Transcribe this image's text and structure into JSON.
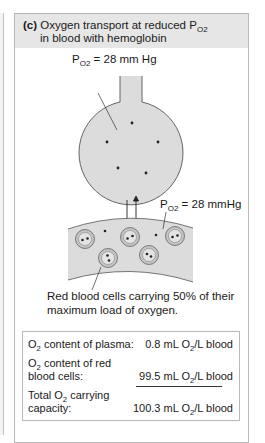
{
  "panel": {
    "letter": "(c)",
    "title_line1": "Oxygen transport at reduced P",
    "title_sub": "O2",
    "title_line2": "in blood with hemoglobin"
  },
  "labels": {
    "flask_po2_prefix": "P",
    "flask_po2_sub": "O2",
    "flask_po2_value": " = 28 mm Hg",
    "vessel_po2_prefix": "P",
    "vessel_po2_sub": "O2",
    "vessel_po2_value": " = 28 mmHg"
  },
  "caption": {
    "line1": "Red blood cells carrying 50% of their",
    "line2": "maximum load of oxygen."
  },
  "table": {
    "rows": [
      {
        "label_pre": "O",
        "label_sub": "2",
        "label_post": " content of plasma:",
        "value_pre": "0.8 mL O",
        "value_sub": "2",
        "value_post": "/L blood"
      },
      {
        "label_pre": "O",
        "label_sub": "2",
        "label_post": " content of red",
        "label_line2": "blood cells:",
        "value_pre": "99.5 mL O",
        "value_sub": "2",
        "value_post": "/L blood"
      },
      {
        "label_pre": "Total O",
        "label_sub": "2",
        "label_post": " carrying",
        "label_line2": "capacity:",
        "value_pre": "100.3 mL O",
        "value_sub": "2",
        "value_post": "/L blood"
      }
    ]
  },
  "colors": {
    "header_bg": "#e6e6e6",
    "fluid": "#dcdcdc",
    "cell_outer": "#c4c4c4",
    "cell_inner": "#e4e4e4",
    "dot": "#222222"
  }
}
